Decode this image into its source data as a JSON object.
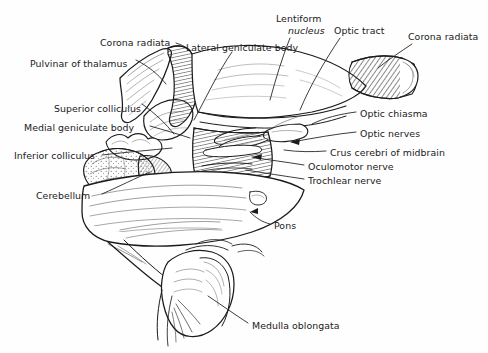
{
  "figure": {
    "background_color": "#fefefe",
    "ink_color": "#1a1a1a",
    "width": 488,
    "height": 353
  },
  "labels": [
    {
      "id": "corona-radiata-left",
      "text": "Corona radiata",
      "x": 100,
      "y": 37,
      "align": "left"
    },
    {
      "id": "pulvinar-of-thalamus",
      "text": "Pulvinar of thalamus",
      "x": 30,
      "y": 58,
      "align": "left"
    },
    {
      "id": "lateral-geniculate-body",
      "text": "Lateral geniculate body",
      "x": 186,
      "y": 42,
      "align": "left"
    },
    {
      "id": "lentiform",
      "text": "Lentiform",
      "x": 276,
      "y": 13,
      "align": "left"
    },
    {
      "id": "nucleus",
      "text": "nucleus",
      "x": 288,
      "y": 25,
      "align": "left",
      "italic": true
    },
    {
      "id": "optic-tract",
      "text": "Optic tract",
      "x": 334,
      "y": 25,
      "align": "left"
    },
    {
      "id": "corona-radiata-right",
      "text": "Corona radiata",
      "x": 408,
      "y": 31,
      "align": "left"
    },
    {
      "id": "superior-colliculus",
      "text": "Superior colliculus",
      "x": 54,
      "y": 103,
      "align": "left"
    },
    {
      "id": "medial-geniculate-body",
      "text": "Medial geniculate body",
      "x": 24,
      "y": 122,
      "align": "left"
    },
    {
      "id": "inferior-colliculus",
      "text": "Inferior colliculus",
      "x": 14,
      "y": 150,
      "align": "left"
    },
    {
      "id": "cerebellum",
      "text": "Cerebellum",
      "x": 36,
      "y": 190,
      "align": "left"
    },
    {
      "id": "optic-chiasma",
      "text": "Optic chiasma",
      "x": 360,
      "y": 108,
      "align": "left"
    },
    {
      "id": "optic-nerves",
      "text": "Optic nerves",
      "x": 360,
      "y": 128,
      "align": "left"
    },
    {
      "id": "crus-cerebri-of-midbrain",
      "text": "Crus cerebri of midbrain",
      "x": 330,
      "y": 147,
      "align": "left"
    },
    {
      "id": "oculomotor-nerve",
      "text": "Oculomotor nerve",
      "x": 308,
      "y": 161,
      "align": "left"
    },
    {
      "id": "trochlear-nerve",
      "text": "Trochlear nerve",
      "x": 308,
      "y": 175,
      "align": "left"
    },
    {
      "id": "pons",
      "text": "Pons",
      "x": 274,
      "y": 220,
      "align": "left"
    },
    {
      "id": "medulla-oblongata",
      "text": "Medulla oblongata",
      "x": 252,
      "y": 320,
      "align": "left"
    }
  ],
  "structures": [
    {
      "id": "corona-radiata-fibers",
      "name": "Corona radiata"
    },
    {
      "id": "pulvinar",
      "name": "Pulvinar of thalamus"
    },
    {
      "id": "lateral-geniculate",
      "name": "Lateral geniculate body"
    },
    {
      "id": "medial-geniculate",
      "name": "Medial geniculate body"
    },
    {
      "id": "superior-colliculus-body",
      "name": "Superior colliculus"
    },
    {
      "id": "inferior-colliculus-body",
      "name": "Inferior colliculus"
    },
    {
      "id": "cerebellum-body",
      "name": "Cerebellum"
    },
    {
      "id": "optic-tract-band",
      "name": "Optic tract"
    },
    {
      "id": "optic-chiasma-body",
      "name": "Optic chiasma"
    },
    {
      "id": "optic-nerve-stumps",
      "name": "Optic nerves"
    },
    {
      "id": "crus-cerebri-body",
      "name": "Crus cerebri of midbrain"
    },
    {
      "id": "oculomotor-nerve-root",
      "name": "Oculomotor nerve"
    },
    {
      "id": "trochlear-nerve-root",
      "name": "Trochlear nerve"
    },
    {
      "id": "pons-body",
      "name": "Pons"
    },
    {
      "id": "medulla-body",
      "name": "Medulla oblongata"
    },
    {
      "id": "lentiform-nucleus-body",
      "name": "Lentiform nucleus"
    }
  ]
}
